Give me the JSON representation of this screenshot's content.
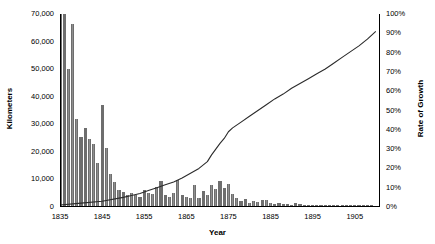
{
  "chart_data": {
    "type": "bar",
    "title": "",
    "xlabel": "Year",
    "ylabel": "Kilometers",
    "y2label": "Rate of Growth",
    "grid": false,
    "legend": "none",
    "ylim": [
      0,
      70000
    ],
    "y2lim": [
      0,
      1.0
    ],
    "xlim": [
      1835,
      1911
    ],
    "y_ticklabels": [
      "70,000",
      "60,000",
      "50,000",
      "40,000",
      "30,000",
      "20,000",
      "10,000",
      "0"
    ],
    "y_tickvalues": [
      70000,
      60000,
      50000,
      40000,
      30000,
      20000,
      10000,
      0
    ],
    "y2_ticklabels": [
      "100%",
      "90%",
      "80%",
      "70%",
      "60%",
      "50%",
      "40%",
      "30%",
      "20%",
      "10%",
      "0%"
    ],
    "y2_tickvalues": [
      1.0,
      0.9,
      0.8,
      0.7,
      0.6,
      0.5,
      0.4,
      0.3,
      0.2,
      0.1,
      0.0
    ],
    "x_ticklabels": [
      "1835",
      "1845",
      "1855",
      "1865",
      "1875",
      "1885",
      "1895",
      "1905"
    ],
    "x_tickvalues": [
      1835,
      1845,
      1855,
      1865,
      1875,
      1885,
      1895,
      1905
    ],
    "bar_color": "#6e6e6e",
    "line_color": "#2b2b2b",
    "series": [
      {
        "name": "Kilometers",
        "axis": "left",
        "render": "bar",
        "x": [
          1835,
          1836,
          1837,
          1838,
          1839,
          1840,
          1841,
          1842,
          1843,
          1844,
          1845,
          1846,
          1847,
          1848,
          1849,
          1850,
          1851,
          1852,
          1853,
          1854,
          1855,
          1856,
          1857,
          1858,
          1859,
          1860,
          1861,
          1862,
          1863,
          1864,
          1865,
          1866,
          1867,
          1868,
          1869,
          1870,
          1871,
          1872,
          1873,
          1874,
          1875,
          1876,
          1877,
          1878,
          1879,
          1880,
          1881,
          1882,
          1883,
          1884,
          1885,
          1886,
          1887,
          1888,
          1889,
          1890,
          1891,
          1892,
          1893,
          1894,
          1895,
          1896,
          1897,
          1898,
          1899,
          1900,
          1901,
          1902,
          1903,
          1904,
          1905,
          1906,
          1907,
          1908,
          1909,
          1910
        ],
        "values": [
          70000,
          70000,
          50000,
          66500,
          32000,
          25500,
          28500,
          24500,
          23000,
          16000,
          37000,
          21500,
          12000,
          9000,
          6000,
          5500,
          4500,
          5000,
          4200,
          3600,
          6200,
          5000,
          4800,
          7200,
          9500,
          4500,
          3600,
          5200,
          9800,
          4200,
          3800,
          3400,
          7800,
          3100,
          5800,
          4400,
          8000,
          6600,
          9600,
          7000,
          8200,
          4600,
          3200,
          2100,
          2800,
          1600,
          2200,
          1800,
          2600,
          2400,
          1500,
          1200,
          1400,
          1000,
          1100,
          900,
          1300,
          1000,
          800,
          700,
          900,
          650,
          700,
          800,
          600,
          900,
          700,
          600,
          800,
          700,
          600,
          700,
          900,
          700,
          600,
          500
        ]
      },
      {
        "name": "Rate of Growth",
        "axis": "right",
        "render": "line",
        "x": [
          1835,
          1840,
          1845,
          1850,
          1852,
          1854,
          1856,
          1858,
          1860,
          1862,
          1864,
          1866,
          1868,
          1870,
          1871,
          1872,
          1873,
          1874,
          1875,
          1876,
          1878,
          1880,
          1882,
          1884,
          1886,
          1888,
          1890,
          1892,
          1894,
          1896,
          1898,
          1900,
          1902,
          1904,
          1906,
          1908,
          1910
        ],
        "values": [
          0.01,
          0.02,
          0.03,
          0.05,
          0.06,
          0.07,
          0.085,
          0.1,
          0.115,
          0.13,
          0.15,
          0.175,
          0.2,
          0.235,
          0.27,
          0.3,
          0.33,
          0.355,
          0.39,
          0.41,
          0.44,
          0.47,
          0.5,
          0.53,
          0.56,
          0.585,
          0.615,
          0.64,
          0.665,
          0.69,
          0.715,
          0.745,
          0.775,
          0.805,
          0.835,
          0.87,
          0.91
        ]
      }
    ]
  }
}
